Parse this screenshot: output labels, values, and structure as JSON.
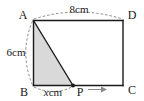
{
  "figure": {
    "type": "geometry-diagram",
    "shape": "rectangle-with-inscribed-shaded-triangle",
    "vertices": [
      {
        "id": "A",
        "label": "A",
        "position": "top-left"
      },
      {
        "id": "D",
        "label": "D",
        "position": "top-right"
      },
      {
        "id": "B",
        "label": "B",
        "position": "bottom-left"
      },
      {
        "id": "C",
        "label": "C",
        "position": "bottom-right"
      },
      {
        "id": "P",
        "label": "P",
        "position": "bottom-edge-interior"
      }
    ],
    "measurements": [
      {
        "id": "top",
        "label": "8cm",
        "value": 8,
        "unit": "cm",
        "edge": "AD",
        "annotation": "dashed-arc-above"
      },
      {
        "id": "left",
        "label": "6cm",
        "value": 6,
        "unit": "cm",
        "edge": "AB",
        "annotation": "dashed-arc-left"
      },
      {
        "id": "bottom",
        "label_italic": "x",
        "label_rest": "cm",
        "label": "xcm",
        "value": "x",
        "unit": "cm",
        "edge": "BP",
        "annotation": "dashed-arc-below"
      }
    ],
    "motion": {
      "point": "P",
      "arrow_glyph": "→",
      "direction": "right",
      "along": "BC"
    },
    "shaded_region": {
      "name": "triangle-ABP",
      "vertices": [
        "A",
        "B",
        "P"
      ],
      "fill_color": "#d9d9d9"
    },
    "colors": {
      "stroke": "#1a1a1a",
      "shade": "#d9d9d9",
      "dashed": "#7a7a7a",
      "arrow": "#8a8a8a",
      "background": "#ffffff"
    }
  }
}
